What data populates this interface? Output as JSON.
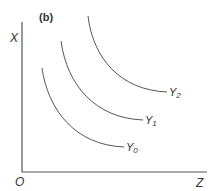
{
  "diagram": {
    "panel_label": "(b)",
    "axes": {
      "y_label": "X",
      "x_label": "Z",
      "origin_label": "O"
    },
    "curves": [
      {
        "name": "Y",
        "subscript": "0"
      },
      {
        "name": "Y",
        "subscript": "1"
      },
      {
        "name": "Y",
        "subscript": "2"
      }
    ],
    "colors": {
      "line": "#555555",
      "text": "#333333",
      "background": "#ffffff"
    }
  }
}
